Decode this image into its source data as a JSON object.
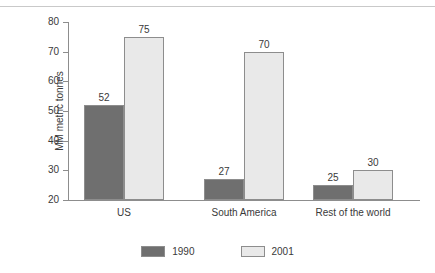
{
  "chart_data": {
    "type": "bar",
    "title": "",
    "xlabel": "",
    "ylabel": "MM metric tonnes",
    "ylim": [
      20,
      80
    ],
    "yticks": [
      20,
      30,
      40,
      50,
      60,
      70,
      80
    ],
    "grid": false,
    "legend_position": "bottom",
    "categories": [
      "US",
      "South America",
      "Rest of the world"
    ],
    "series": [
      {
        "name": "1990",
        "color": "#6f6f6f",
        "values": [
          52,
          27,
          25
        ]
      },
      {
        "name": "2001",
        "color": "#e9e9e9",
        "values": [
          75,
          70,
          30
        ]
      }
    ],
    "data_labels": {
      "1990": [
        "52",
        "27",
        "25"
      ],
      "2001": [
        "75",
        "70",
        "30"
      ]
    }
  },
  "axis": {
    "tick_labels": [
      "80",
      "70",
      "60",
      "50",
      "40",
      "30",
      "20"
    ],
    "y_title": "MM metric tonnes"
  },
  "categories": {
    "c0": "US",
    "c1": "South America",
    "c2": "Rest of the world"
  },
  "legend": {
    "items": [
      {
        "label": "1990"
      },
      {
        "label": "2001"
      }
    ]
  }
}
